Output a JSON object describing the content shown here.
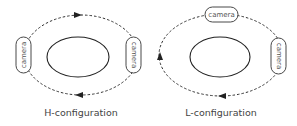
{
  "diagrams": [
    {
      "id": "h",
      "label": "H-configuration",
      "cameras": [
        {
          "label": "camera",
          "position": "left",
          "orientation": "vertical"
        },
        {
          "label": "camera",
          "position": "right",
          "orientation": "vertical"
        }
      ],
      "path_direction": "clockwise",
      "arrows": [
        {
          "position": "top",
          "direction": "right"
        },
        {
          "position": "bottom",
          "direction": "left"
        }
      ]
    },
    {
      "id": "l",
      "label": "L-configuration",
      "cameras": [
        {
          "label": "camera",
          "position": "top",
          "orientation": "horizontal"
        },
        {
          "label": "camera",
          "position": "right",
          "orientation": "vertical"
        }
      ],
      "path_direction": "clockwise",
      "arrows": [
        {
          "position": "left",
          "direction": "up"
        },
        {
          "position": "bottom",
          "direction": "left"
        }
      ]
    }
  ],
  "colors": {
    "stroke": "#2b2b2b",
    "text": "#444444"
  }
}
